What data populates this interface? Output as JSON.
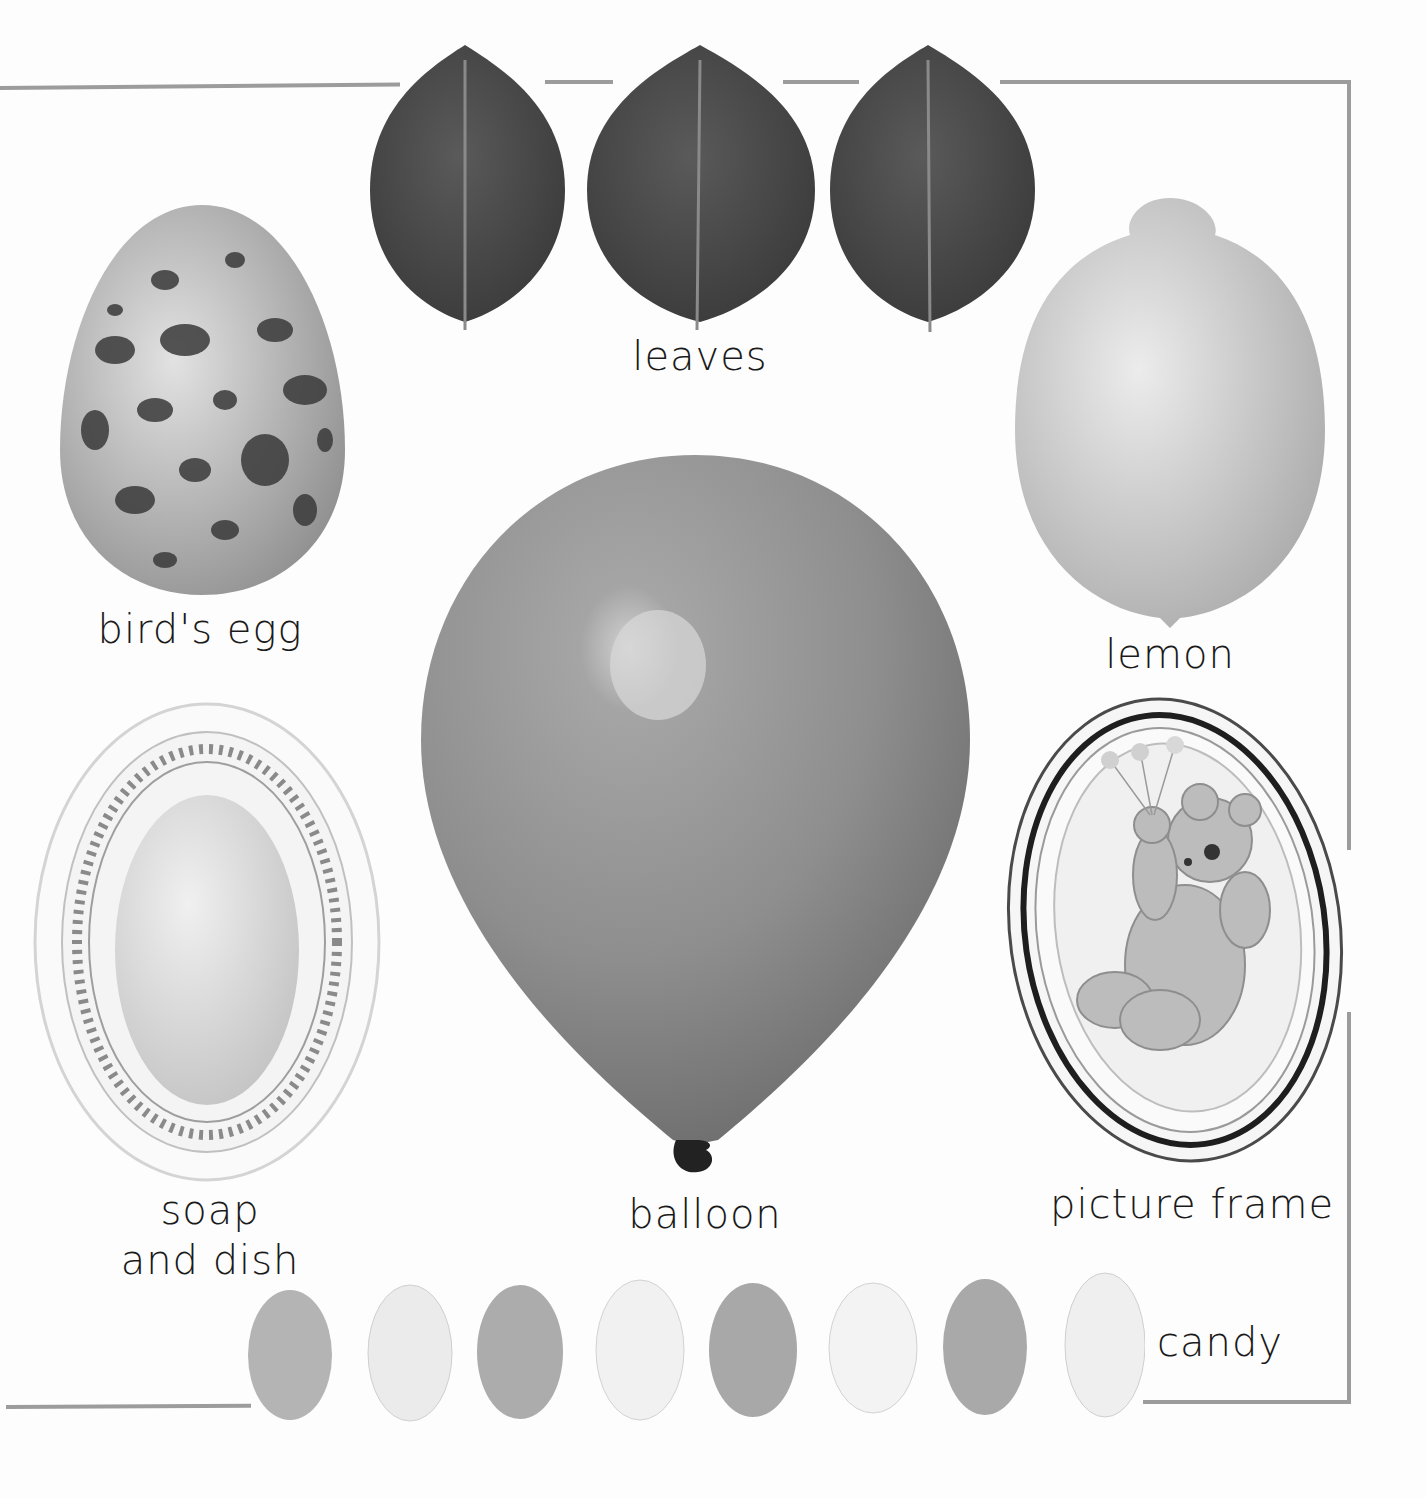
{
  "page": {
    "background": "#fdfdfd",
    "border_color": "#9c9c9c"
  },
  "items": {
    "leaves": {
      "label": "leaves",
      "count": 3,
      "color": "#4a4a4a"
    },
    "birds_egg": {
      "label": "bird's egg",
      "base_color": "#bdbdbd",
      "speckle_color": "#3a3a3a"
    },
    "lemon": {
      "label": "lemon",
      "color": "#d6d6d6"
    },
    "soap_and_dish": {
      "label_line1": "soap",
      "label_line2": "and dish",
      "soap_color": "#e2e2e2",
      "dish_color": "#f2f2f2"
    },
    "balloon": {
      "label": "balloon",
      "color": "#8e8e8e",
      "knot_color": "#222222"
    },
    "picture_frame": {
      "label": "picture frame",
      "frame_color": "#f4f4f4",
      "picture_color": "#c8c8c8"
    },
    "candy": {
      "label": "candy",
      "pieces": [
        {
          "shade": "#b4b4b4"
        },
        {
          "shade": "#ebebeb"
        },
        {
          "shade": "#acacac"
        },
        {
          "shade": "#f1f1f1"
        },
        {
          "shade": "#a8a8a8"
        },
        {
          "shade": "#f3f3f3"
        },
        {
          "shade": "#a9a9a9"
        },
        {
          "shade": "#efefef"
        }
      ]
    }
  }
}
